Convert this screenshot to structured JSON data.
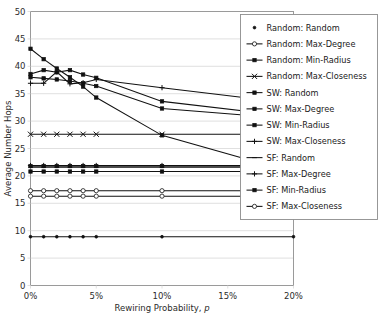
{
  "chart_data": {
    "type": "line",
    "title": "",
    "xlabel": "Rewiring Probability, p",
    "ylabel": "Average Number Hops",
    "xlim": [
      0,
      20
    ],
    "ylim": [
      0,
      50
    ],
    "x_ticks": [
      0,
      5,
      10,
      15,
      20
    ],
    "x_tick_labels": [
      "0%",
      "5%",
      "10%",
      "15%",
      "20%"
    ],
    "y_ticks": [
      0,
      5,
      10,
      15,
      20,
      25,
      30,
      35,
      40,
      45,
      50
    ],
    "y_tick_labels": [
      "0",
      "5",
      "10",
      "15",
      "20",
      "25",
      "30",
      "35",
      "40",
      "45",
      "50"
    ],
    "grid": true,
    "legend_position": "right",
    "x": [
      0,
      1,
      2,
      3,
      4,
      5,
      10,
      20
    ],
    "series": [
      {
        "name": "Random: Random",
        "marker": "dot",
        "values": [
          8.9,
          8.9,
          8.9,
          8.9,
          8.9,
          8.9,
          8.9,
          8.9
        ]
      },
      {
        "name": "Random: Max-Degree",
        "marker": "open-circle",
        "values": [
          17.3,
          17.3,
          17.3,
          17.3,
          17.3,
          17.3,
          17.3,
          17.3
        ]
      },
      {
        "name": "Random: Min-Radius",
        "marker": "square",
        "values": [
          21.8,
          21.8,
          21.8,
          21.8,
          21.8,
          21.8,
          21.8,
          21.8
        ]
      },
      {
        "name": "Random: Max-Closeness",
        "marker": "cross",
        "values": [
          27.6,
          27.6,
          27.6,
          27.6,
          27.6,
          27.6,
          27.6,
          27.6
        ]
      },
      {
        "name": "SW: Random",
        "marker": "square",
        "values": [
          43.2,
          41.3,
          39.6,
          38.0,
          36.3,
          34.3,
          27.4,
          20.6
        ]
      },
      {
        "name": "SW: Max-Degree",
        "marker": "square",
        "values": [
          38.6,
          39.3,
          38.9,
          39.3,
          38.5,
          37.9,
          33.6,
          30.8
        ]
      },
      {
        "name": "SW: Min-Radius",
        "marker": "square",
        "values": [
          38.0,
          37.8,
          37.6,
          37.3,
          36.9,
          36.4,
          32.3,
          30.4
        ]
      },
      {
        "name": "SW: Max-Closeness",
        "marker": "plus",
        "values": [
          36.9,
          36.9,
          39.0,
          36.8,
          37.0,
          37.6,
          36.1,
          33.2
        ]
      },
      {
        "name": "SF: Random",
        "marker": "dash",
        "values": [
          21.6,
          21.6,
          21.6,
          21.6,
          21.6,
          21.6,
          21.6,
          21.6
        ]
      },
      {
        "name": "SF: Max-Degree",
        "marker": "plus",
        "values": [
          21.9,
          21.9,
          21.9,
          21.9,
          21.9,
          21.9,
          21.9,
          21.9
        ]
      },
      {
        "name": "SF: Min-Radius",
        "marker": "square",
        "values": [
          20.8,
          20.8,
          20.8,
          20.8,
          20.8,
          20.8,
          20.8,
          20.8
        ]
      },
      {
        "name": "SF: Max-Closeness",
        "marker": "open-circle",
        "values": [
          16.3,
          16.3,
          16.3,
          16.3,
          16.3,
          16.3,
          16.3,
          16.3
        ]
      }
    ]
  },
  "legend": {
    "items": [
      "Random: Random",
      "Random: Max-Degree",
      "Random: Min-Radius",
      "Random: Max-Closeness",
      "SW: Random",
      "SW: Max-Degree",
      "SW: Min-Radius",
      "SW: Max-Closeness",
      "SF: Random",
      "SF: Max-Degree",
      "SF: Min-Radius",
      "SF: Max-Closeness"
    ]
  },
  "colors": {
    "series": "#111111",
    "grid": "#d8d8d8",
    "frame": "#9a9a9a",
    "background": "#ffffff"
  }
}
